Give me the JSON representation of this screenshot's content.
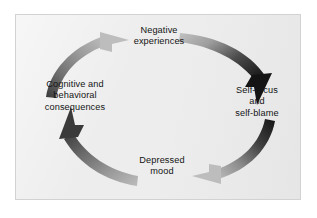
{
  "figure": {
    "type": "cycle-diagram",
    "title": "",
    "orientation": "clockwise",
    "background_color": "#ffffff",
    "panel_color": "#ededed",
    "panel_border_color": "#d2d2d2",
    "text_color": "#141414",
    "arrow_head_color": "#1a1a1a",
    "arrow_tail_color": "#b4b4b4"
  },
  "nodes": [
    {
      "id": "negative-experiences",
      "label": "Negative\nexperiences",
      "position": "top"
    },
    {
      "id": "self-focus",
      "label": "Self-focus\nand\nself-blame",
      "position": "right"
    },
    {
      "id": "depressed-mood",
      "label": "Depressed\nmood",
      "position": "bottom"
    },
    {
      "id": "cognitive-consequences",
      "label": "Cognitive and\nbehavioral\nconsequences",
      "position": "left"
    }
  ],
  "arrows": [
    {
      "id": "arrow-top-right",
      "from": "negative-experiences",
      "to": "self-focus",
      "direction": "clockwise",
      "tail_shade": "light",
      "head_shade": "dark"
    },
    {
      "id": "arrow-bottom-right",
      "from": "self-focus",
      "to": "depressed-mood",
      "direction": "clockwise",
      "tail_shade": "dark",
      "head_shade": "light"
    },
    {
      "id": "arrow-bottom-left",
      "from": "depressed-mood",
      "to": "cognitive-consequences",
      "direction": "clockwise",
      "tail_shade": "light",
      "head_shade": "dark"
    },
    {
      "id": "arrow-top-left",
      "from": "cognitive-consequences",
      "to": "negative-experiences",
      "direction": "clockwise",
      "tail_shade": "dark",
      "head_shade": "light"
    }
  ]
}
